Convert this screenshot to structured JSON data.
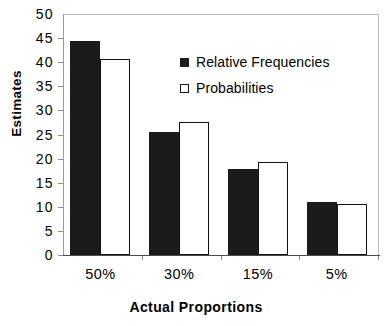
{
  "chart_data": {
    "type": "bar",
    "title": "",
    "xlabel": "Actual  Proportions",
    "ylabel": "Estimates",
    "categories": [
      "50%",
      "30%",
      "15%",
      "5%"
    ],
    "series": [
      {
        "name": "Relative Frequencies",
        "values": [
          44.5,
          25.5,
          17.8,
          11.0
        ],
        "color": "#1b1b1b",
        "style": "filled"
      },
      {
        "name": "Probabilities",
        "values": [
          40.6,
          27.7,
          19.4,
          10.5
        ],
        "color": "#ffffff",
        "style": "open"
      }
    ],
    "ylim": [
      0,
      50
    ],
    "ytick_step": 5,
    "yticks": [
      "50",
      "45",
      "40",
      "35",
      "30",
      "25",
      "20",
      "15",
      "10",
      "5",
      "0"
    ],
    "grid": false,
    "legend_position": "upper-right-inside"
  },
  "legend": {
    "entries": [
      {
        "label": "Relative Frequencies",
        "swatch": "filled-square-icon"
      },
      {
        "label": "Probabilities",
        "swatch": "open-square-icon"
      }
    ]
  },
  "axes": {
    "y_title": "Estimates",
    "x_title": "Actual  Proportions"
  }
}
